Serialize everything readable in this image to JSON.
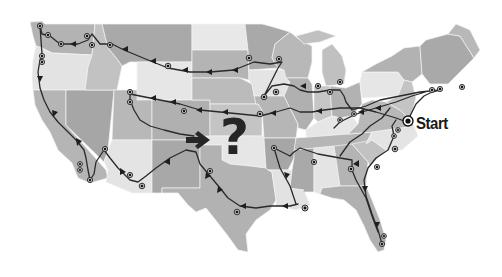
{
  "map": {
    "title": "",
    "background": "#ffffff",
    "colors": {
      "dark": "#a9a9a9",
      "mid": "#b8b8b8",
      "light": "#c6c6c6",
      "pale": "#e6e6e6",
      "route": "#2a2a2a"
    },
    "labels": {
      "start": "Start",
      "question": "?"
    },
    "icons": {
      "arrow": "right-arrow-icon",
      "question": "question-mark-icon",
      "stop": "route-stop-icon"
    }
  }
}
